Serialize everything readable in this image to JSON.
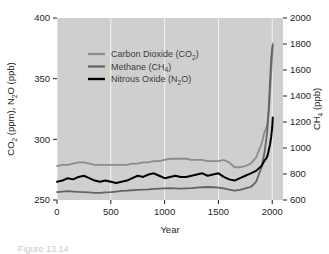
{
  "figure": {
    "caption_partial": "Figure 13.14"
  },
  "chart_data": {
    "type": "line",
    "title": "",
    "xlabel": "Year",
    "ylabel": "CO2 (ppm), N2O (ppb)",
    "ylabel_parts": {
      "a": "CO",
      "a_sub": "2",
      "a_unit": " (ppm), N",
      "b_sub": "2",
      "b_unit": "O (ppb)"
    },
    "y2label": "CH4 (ppb)",
    "y2label_parts": {
      "a": "CH",
      "a_sub": "4",
      "a_unit": " (ppb)"
    },
    "xlim": [
      0,
      2100
    ],
    "ylim": [
      250,
      400
    ],
    "y2lim": [
      600,
      2000
    ],
    "xticks": [
      0,
      500,
      1000,
      1500,
      2000
    ],
    "yticks": [
      250,
      300,
      350,
      400
    ],
    "y2ticks": [
      600,
      800,
      1000,
      1200,
      1400,
      1600,
      1800,
      2000
    ],
    "grid": "vertical-white",
    "plot_background": "#cfcfcf",
    "legend_position": "upper-left-inside",
    "legend": [
      {
        "label": "Carbon Dioxide (CO2)",
        "text_main": "Carbon Dioxide (CO",
        "sub": "2",
        "tail": ")",
        "color": "#8c8c8c"
      },
      {
        "label": "Methane (CH4)",
        "text_main": "Methane (CH",
        "sub": "4",
        "tail": ")",
        "color": "#636363"
      },
      {
        "label": "Nitrous Oxide (N2O)",
        "text_main": "Nitrous Oxide (N",
        "sub": "2",
        "tail": "O)",
        "color": "#000000"
      }
    ],
    "series": [
      {
        "name": "Carbon Dioxide (CO2)",
        "axis": "left",
        "unit": "ppm",
        "color": "#8c8c8c",
        "x": [
          0,
          50,
          100,
          150,
          200,
          250,
          300,
          350,
          400,
          450,
          500,
          550,
          600,
          650,
          700,
          750,
          800,
          850,
          900,
          950,
          1000,
          1050,
          1100,
          1150,
          1200,
          1250,
          1300,
          1350,
          1400,
          1450,
          1500,
          1550,
          1600,
          1650,
          1700,
          1750,
          1800,
          1850,
          1900,
          1925,
          1950,
          1960,
          1970,
          1980,
          1990,
          2000,
          2005
        ],
        "y": [
          278,
          279,
          279,
          280,
          281,
          281,
          280,
          279,
          279,
          279,
          279,
          279,
          279,
          279,
          280,
          280,
          281,
          281,
          282,
          282,
          283,
          284,
          284,
          284,
          284,
          283,
          283,
          283,
          282,
          282,
          282,
          283,
          281,
          277,
          277,
          278,
          280,
          285,
          296,
          305,
          311,
          317,
          325,
          339,
          354,
          369,
          379
        ]
      },
      {
        "name": "Methane (CH4)",
        "axis": "right",
        "unit": "ppb",
        "color": "#636363",
        "x": [
          0,
          50,
          100,
          150,
          200,
          250,
          300,
          350,
          400,
          450,
          500,
          550,
          600,
          650,
          700,
          750,
          800,
          850,
          900,
          950,
          1000,
          1050,
          1100,
          1150,
          1200,
          1250,
          1300,
          1350,
          1400,
          1450,
          1500,
          1550,
          1600,
          1650,
          1700,
          1750,
          1800,
          1850,
          1900,
          1925,
          1950,
          1960,
          1970,
          1980,
          1990,
          2000,
          2005
        ],
        "y": [
          660,
          665,
          668,
          665,
          662,
          660,
          658,
          655,
          655,
          658,
          660,
          665,
          670,
          672,
          675,
          678,
          680,
          682,
          685,
          688,
          690,
          692,
          690,
          688,
          690,
          692,
          695,
          698,
          700,
          698,
          695,
          690,
          680,
          672,
          678,
          690,
          700,
          740,
          850,
          950,
          1100,
          1200,
          1350,
          1520,
          1680,
          1770,
          1790
        ]
      },
      {
        "name": "Nitrous Oxide (N2O)",
        "axis": "left",
        "unit": "ppb",
        "color": "#000000",
        "x": [
          0,
          50,
          100,
          150,
          200,
          250,
          300,
          350,
          400,
          450,
          500,
          550,
          600,
          650,
          700,
          750,
          800,
          850,
          900,
          950,
          1000,
          1050,
          1100,
          1150,
          1200,
          1250,
          1300,
          1350,
          1400,
          1450,
          1500,
          1550,
          1600,
          1650,
          1700,
          1750,
          1800,
          1850,
          1900,
          1925,
          1950,
          1960,
          1970,
          1980,
          1990,
          2000,
          2005
        ],
        "y": [
          265,
          266,
          268,
          267,
          269,
          270,
          268,
          266,
          265,
          266,
          265,
          264,
          265,
          266,
          268,
          270,
          269,
          271,
          272,
          270,
          268,
          269,
          270,
          269,
          269,
          270,
          271,
          272,
          270,
          271,
          272,
          269,
          267,
          266,
          268,
          270,
          272,
          274,
          278,
          282,
          285,
          288,
          292,
          296,
          302,
          310,
          318
        ]
      }
    ]
  }
}
